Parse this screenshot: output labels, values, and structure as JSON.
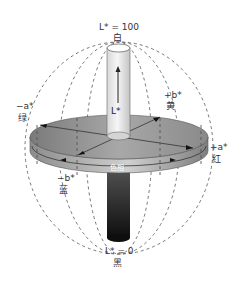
{
  "diagram": {
    "axes": {
      "top": {
        "value": "L* = 100",
        "name": "白"
      },
      "bottom": {
        "value": "L* = 0",
        "name": "黑"
      },
      "center": {
        "value": "L*"
      },
      "pos_a": {
        "value": "+a*",
        "name": "红"
      },
      "neg_a": {
        "value": "−a*",
        "name": "绿"
      },
      "pos_b": {
        "value": "+b*",
        "name": "黄"
      },
      "neg_b": {
        "value": "−b*",
        "name": "蓝"
      }
    },
    "hue_label": "色相",
    "colors": {
      "disc_top": "#8a8a8a",
      "disc_side": "#9c9c9c",
      "cylinder_top": "#e8e8e8",
      "cylinder_bottom": "#1a1a1a",
      "dash": "#555555",
      "text": "#333333"
    }
  }
}
